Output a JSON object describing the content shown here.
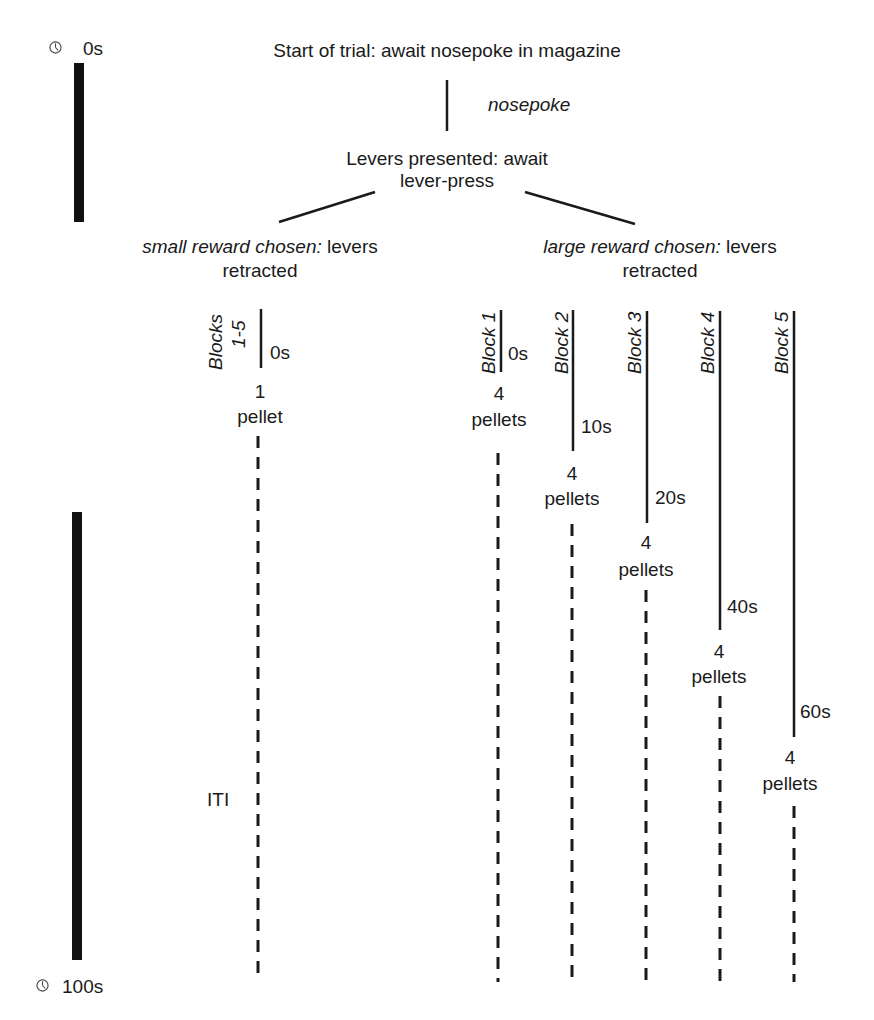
{
  "timeline": {
    "start_label": "0s",
    "end_label": "100s",
    "icon": "clock-icon"
  },
  "flow": {
    "start": "Start of trial: await nosepoke in magazine",
    "nosepoke": "nosepoke",
    "levers_line1": "Levers presented: await",
    "levers_line2": "lever-press",
    "small_italic": "small reward chosen:",
    "small_rest": " levers",
    "small_line2": "retracted",
    "large_italic": "large reward chosen:",
    "large_rest": " levers",
    "large_line2": "retracted",
    "iti": "ITI"
  },
  "small_branch": {
    "block_label_1": "Blocks",
    "block_label_2": "1-5",
    "delay": "0s",
    "reward_count": "1",
    "reward_unit": "pellet"
  },
  "large_branch": [
    {
      "block": "Block 1",
      "delay": "0s",
      "reward_count": "4",
      "reward_unit": "pellets"
    },
    {
      "block": "Block 2",
      "delay": "10s",
      "reward_count": "4",
      "reward_unit": "pellets"
    },
    {
      "block": "Block 3",
      "delay": "20s",
      "reward_count": "4",
      "reward_unit": "pellets"
    },
    {
      "block": "Block 4",
      "delay": "40s",
      "reward_count": "4",
      "reward_unit": "pellets"
    },
    {
      "block": "Block 5",
      "delay": "60s",
      "reward_count": "4",
      "reward_unit": "pellets"
    }
  ],
  "colors": {
    "ink": "#1a1a1a",
    "bar": "#111111"
  }
}
